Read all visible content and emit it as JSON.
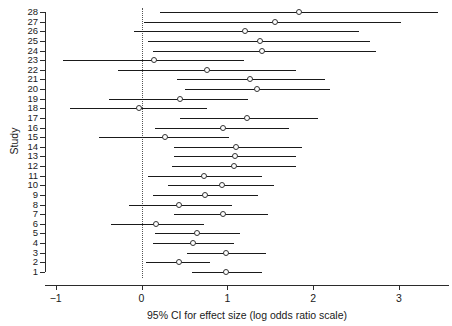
{
  "chart_data": {
    "type": "scatter",
    "title": "",
    "xlabel": "95% CI for effect size (log odds ratio scale)",
    "ylabel": "Study",
    "xlim": [
      -1.15,
      3.55
    ],
    "ylim": [
      0.5,
      28.5
    ],
    "grid": false,
    "legend": null,
    "reference_line": 0,
    "reference_line_style": "dotted",
    "xticks": [
      -1,
      0,
      1,
      2,
      3
    ],
    "xtick_labels": [
      "−1",
      "0",
      "1",
      "2",
      "3"
    ],
    "yticks": [
      1,
      2,
      3,
      4,
      5,
      6,
      7,
      8,
      9,
      10,
      11,
      12,
      13,
      14,
      15,
      16,
      17,
      18,
      19,
      20,
      21,
      22,
      23,
      24,
      25,
      26,
      27,
      28
    ],
    "ytick_labels": [
      "1",
      "2",
      "3",
      "4",
      "5",
      "6",
      "7",
      "8",
      "9",
      "10",
      "11",
      "12",
      "13",
      "14",
      "15",
      "16",
      "17",
      "18",
      "19",
      "20",
      "21",
      "22",
      "23",
      "24",
      "25",
      "26",
      "27",
      "28"
    ],
    "marker": "open-circle",
    "studies": [
      {
        "study": 28,
        "estimate": 1.83,
        "ci_low": 0.22,
        "ci_high": 3.45
      },
      {
        "study": 27,
        "estimate": 1.56,
        "ci_low": 0.03,
        "ci_high": 3.03
      },
      {
        "study": 26,
        "estimate": 1.21,
        "ci_low": -0.09,
        "ci_high": 2.53
      },
      {
        "study": 25,
        "estimate": 1.38,
        "ci_low": 0.08,
        "ci_high": 2.66
      },
      {
        "study": 24,
        "estimate": 1.41,
        "ci_low": 0.13,
        "ci_high": 2.73
      },
      {
        "study": 23,
        "estimate": 0.15,
        "ci_low": -0.92,
        "ci_high": 1.2
      },
      {
        "study": 22,
        "estimate": 0.76,
        "ci_low": -0.27,
        "ci_high": 1.8
      },
      {
        "study": 21,
        "estimate": 1.27,
        "ci_low": 0.41,
        "ci_high": 2.14
      },
      {
        "study": 20,
        "estimate": 1.35,
        "ci_low": 0.51,
        "ci_high": 2.2
      },
      {
        "study": 19,
        "estimate": 0.45,
        "ci_low": -0.38,
        "ci_high": 1.24
      },
      {
        "study": 18,
        "estimate": -0.03,
        "ci_low": -0.83,
        "ci_high": 0.76
      },
      {
        "study": 17,
        "estimate": 1.23,
        "ci_low": 0.45,
        "ci_high": 2.06
      },
      {
        "study": 16,
        "estimate": 0.95,
        "ci_low": 0.16,
        "ci_high": 1.72
      },
      {
        "study": 15,
        "estimate": 0.27,
        "ci_low": -0.5,
        "ci_high": 1.02
      },
      {
        "study": 14,
        "estimate": 1.1,
        "ci_low": 0.38,
        "ci_high": 1.87
      },
      {
        "study": 13,
        "estimate": 1.09,
        "ci_low": 0.38,
        "ci_high": 1.8
      },
      {
        "study": 12,
        "estimate": 1.08,
        "ci_low": 0.35,
        "ci_high": 1.8
      },
      {
        "study": 11,
        "estimate": 0.73,
        "ci_low": 0.08,
        "ci_high": 1.41
      },
      {
        "study": 10,
        "estimate": 0.94,
        "ci_low": 0.31,
        "ci_high": 1.55
      },
      {
        "study": 9,
        "estimate": 0.74,
        "ci_low": 0.13,
        "ci_high": 1.36
      },
      {
        "study": 8,
        "estimate": 0.44,
        "ci_low": -0.15,
        "ci_high": 1.06
      },
      {
        "study": 7,
        "estimate": 0.95,
        "ci_low": 0.38,
        "ci_high": 1.48
      },
      {
        "study": 6,
        "estimate": 0.17,
        "ci_low": -0.36,
        "ci_high": 0.73
      },
      {
        "study": 5,
        "estimate": 0.65,
        "ci_low": 0.16,
        "ci_high": 1.15
      },
      {
        "study": 4,
        "estimate": 0.6,
        "ci_low": 0.13,
        "ci_high": 1.08
      },
      {
        "study": 3,
        "estimate": 0.99,
        "ci_low": 0.53,
        "ci_high": 1.45
      },
      {
        "study": 2,
        "estimate": 0.44,
        "ci_low": 0.05,
        "ci_high": 0.8
      },
      {
        "study": 1,
        "estimate": 0.99,
        "ci_low": 0.59,
        "ci_high": 1.4
      }
    ]
  },
  "colors": {
    "axis": "#2b2b2b",
    "line": "#1a1a1a",
    "marker_edge": "#333333",
    "marker_fill": "#ffffff",
    "reference": "#555555",
    "background": "#ffffff"
  }
}
